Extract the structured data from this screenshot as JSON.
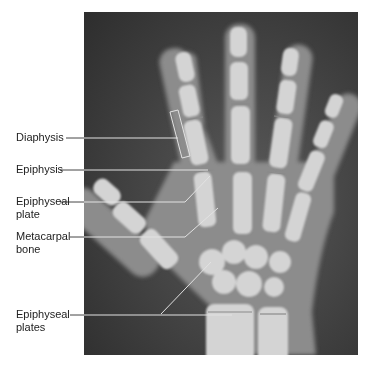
{
  "figure": {
    "labels": [
      {
        "id": "diaphysis",
        "text": "Diaphysis"
      },
      {
        "id": "epiphysis",
        "text": "Epiphysis"
      },
      {
        "id": "epiphyseal-plate",
        "text": "Epiphyseal\nplate"
      },
      {
        "id": "metacarpal-bone",
        "text": "Metacarpal\nbone"
      },
      {
        "id": "epiphyseal-plates",
        "text": "Epiphyseal\nplates"
      }
    ]
  },
  "colors": {
    "background": "#ffffff",
    "xray_dark": "#3a3a3a",
    "bone": "#d8d8d8",
    "leader_line": "#dddddd",
    "label_text": "#222222"
  }
}
